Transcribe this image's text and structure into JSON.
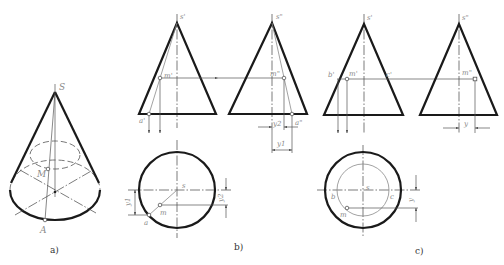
{
  "figure": {
    "panel_a": {
      "caption": "a)",
      "labels": {
        "apex": "S",
        "point_m": "M",
        "point_a": "A"
      }
    },
    "panel_b": {
      "caption": "b)",
      "labels": {
        "front_apex": "s'",
        "side_apex": "s\"",
        "front_m": "m'",
        "side_m": "m\"",
        "front_a": "a'",
        "side_a": "a\"",
        "top_apex": "s",
        "top_m": "m",
        "top_a": "a",
        "dim_y1_side": "y1",
        "dim_y2_side": "y2",
        "dim_y1_top": "y1",
        "dim_y2_top": "y2"
      }
    },
    "panel_c": {
      "caption": "c)",
      "labels": {
        "front_apex": "s'",
        "side_apex": "s\"",
        "front_b": "b'",
        "front_m": "m'",
        "front_c": "c'",
        "side_m": "m\"",
        "top_apex": "s",
        "top_b": "b",
        "top_c": "c",
        "top_m": "m",
        "dim_y_side": "y",
        "dim_y_top": "y"
      }
    },
    "colors": {
      "outline": "#1a1a1a",
      "construction": "#555555",
      "label": "#8a8a8a",
      "background": "#ffffff"
    }
  }
}
